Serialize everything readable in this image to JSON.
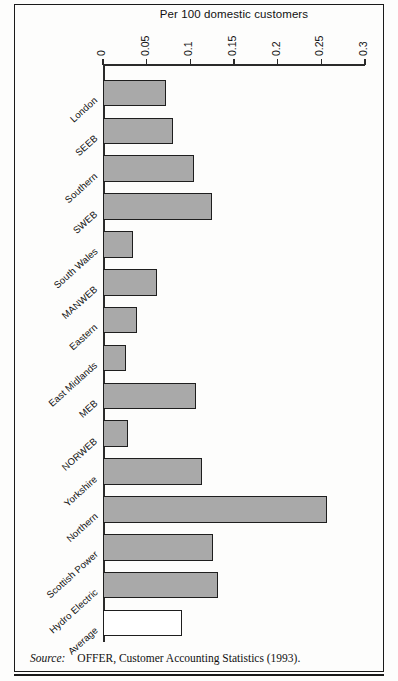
{
  "figure": {
    "axis_title": "Per 100 domestic customers",
    "source_label": "Source:",
    "source_text": "OFFER, Customer Accounting Statistics (1993)."
  },
  "style": {
    "bar_fill": "#a9a9a9",
    "bar_stroke": "#1e1e1e",
    "average_fill": "#ffffff",
    "frame_stroke": "#1a1a1a",
    "background": "#fdfdfc"
  },
  "chart_data": {
    "type": "bar",
    "orientation": "horizontal",
    "title": "",
    "xlabel": "Per 100 domestic customers",
    "ylabel": "",
    "xlim": [
      0,
      0.3
    ],
    "grid": false,
    "legend": "none",
    "axis_position": "top",
    "tick_labels": [
      "0",
      "0.05",
      "0.1",
      "0.15",
      "0.2",
      "0.25",
      "0.3"
    ],
    "ticks": [
      0,
      0.05,
      0.1,
      0.15,
      0.2,
      0.25,
      0.3
    ],
    "categories": [
      "London",
      "SEEB",
      "Southern",
      "SWEB",
      "South Wales",
      "MANWEB",
      "Eastern",
      "East Midlands",
      "MEB",
      "NORWEB",
      "Yorkshire",
      "Northern",
      "Scottish Power",
      "Hydro Electric",
      "Average"
    ],
    "values": [
      0.072,
      0.08,
      0.104,
      0.125,
      0.034,
      0.062,
      0.039,
      0.026,
      0.107,
      0.029,
      0.113,
      0.256,
      0.126,
      0.132,
      0.09
    ],
    "highlight_index": 14,
    "highlight_style": "hollow"
  }
}
